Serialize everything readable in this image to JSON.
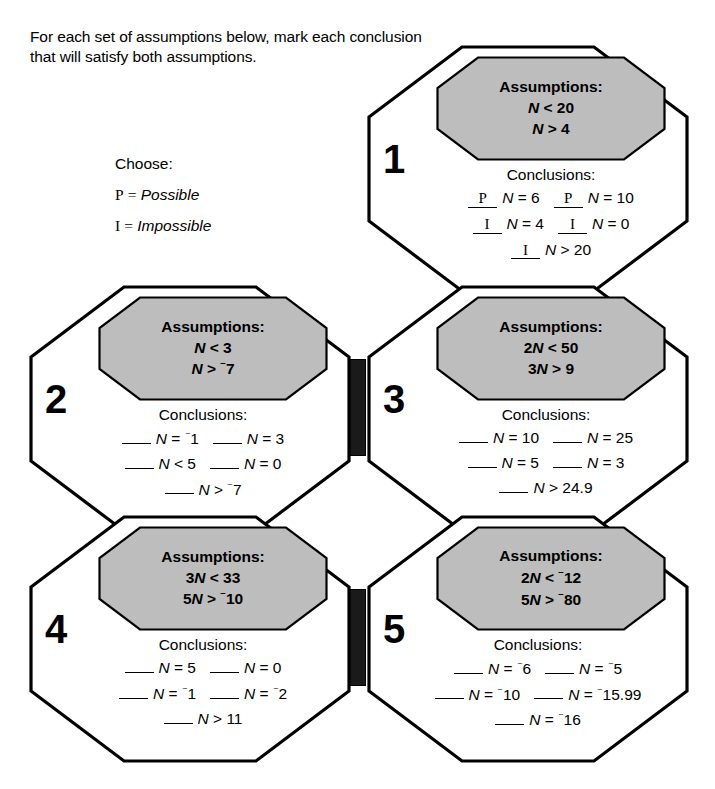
{
  "instructions": "For each set of assumptions below, mark each conclusion that will satisfy both assumptions.",
  "legend": {
    "title": "Choose:",
    "items": [
      {
        "code": "P",
        "equals": "=",
        "word": "Possible"
      },
      {
        "code": "I",
        "equals": "=",
        "word": "Impossible"
      }
    ]
  },
  "labels": {
    "assumptions_heading": "Assumptions:",
    "conclusions_heading": "Conclusions:"
  },
  "colors": {
    "page_background": "#ffffff",
    "ink": "#000000",
    "assumption_fill": "#bdbdbd",
    "connector_fill": "#1a1a1a"
  },
  "cells": [
    {
      "number": "1",
      "assumptions": [
        "N < 20",
        "N > 4"
      ],
      "conclusions": [
        {
          "answer": "P",
          "statement": "N = 6"
        },
        {
          "answer": "P",
          "statement": "N = 10"
        },
        {
          "answer": "I",
          "statement": "N = 4"
        },
        {
          "answer": "I",
          "statement": "N = 0"
        },
        {
          "answer": "I",
          "statement": "N > 20"
        }
      ]
    },
    {
      "number": "2",
      "assumptions": [
        "N < 3",
        "N > -7"
      ],
      "conclusions": [
        {
          "answer": "",
          "statement": "N = -1"
        },
        {
          "answer": "",
          "statement": "N = 3"
        },
        {
          "answer": "",
          "statement": "N < 5"
        },
        {
          "answer": "",
          "statement": "N = 0"
        },
        {
          "answer": "",
          "statement": "N > -7"
        }
      ]
    },
    {
      "number": "3",
      "assumptions": [
        "2N < 50",
        "3N > 9"
      ],
      "conclusions": [
        {
          "answer": "",
          "statement": "N = 10"
        },
        {
          "answer": "",
          "statement": "N = 25"
        },
        {
          "answer": "",
          "statement": "N = 5"
        },
        {
          "answer": "",
          "statement": "N = 3"
        },
        {
          "answer": "",
          "statement": "N > 24.9"
        }
      ]
    },
    {
      "number": "4",
      "assumptions": [
        "3N < 33",
        "5N > -10"
      ],
      "conclusions": [
        {
          "answer": "",
          "statement": "N = 5"
        },
        {
          "answer": "",
          "statement": "N = 0"
        },
        {
          "answer": "",
          "statement": "N = -1"
        },
        {
          "answer": "",
          "statement": "N = -2"
        },
        {
          "answer": "",
          "statement": "N > 11"
        }
      ]
    },
    {
      "number": "5",
      "assumptions": [
        "2N < -12",
        "5N > -80"
      ],
      "conclusions": [
        {
          "answer": "",
          "statement": "N = -6"
        },
        {
          "answer": "",
          "statement": "N = -5"
        },
        {
          "answer": "",
          "statement": "N = -10"
        },
        {
          "answer": "",
          "statement": "N = -15.99"
        },
        {
          "answer": "",
          "statement": "N = -16"
        }
      ]
    }
  ]
}
